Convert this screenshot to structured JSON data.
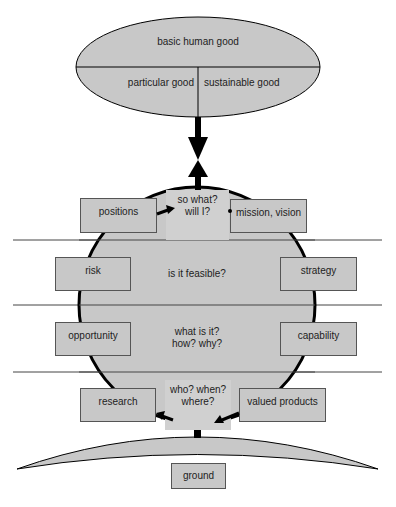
{
  "colors": {
    "fill": "#c8c8c8",
    "question_fill": "#d0d0d0",
    "stroke": "#000000",
    "line": "#444444",
    "background": "#ffffff"
  },
  "top_ellipse": {
    "top_label": "basic human good",
    "left_label": "particular good",
    "right_label": "sustainable good"
  },
  "center_questions": {
    "top": [
      "so what?",
      "will I?"
    ],
    "upper_middle": "is it feasible?",
    "lower_middle": [
      "what is it?",
      "how? why?"
    ],
    "bottom": [
      "who? when?",
      "where?"
    ]
  },
  "side_boxes": {
    "positions": "positions",
    "mission_vision": "mission, vision",
    "risk": "risk",
    "strategy": "strategy",
    "opportunity": "opportunity",
    "capability": "capability",
    "research": "research",
    "valued_products": "valued products"
  },
  "ground": {
    "label": "ground"
  }
}
